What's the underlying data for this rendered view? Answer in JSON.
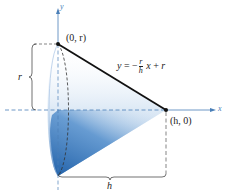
{
  "diagram": {
    "axes": {
      "x_label": "x",
      "y_label": "y"
    },
    "points": {
      "top": "(0, r)",
      "right": "(h, 0)"
    },
    "equation": {
      "lhs": "y",
      "equals": "=",
      "minus": "−",
      "frac_num": "r",
      "frac_den": "h",
      "x": "x",
      "plus": "+",
      "rhs": "r"
    },
    "dimensions": {
      "radius_label": "r",
      "height_label": "h"
    },
    "colors": {
      "cone_fill": "#2a6db5",
      "line": "#111111",
      "axis": "#4a7fb8"
    }
  }
}
